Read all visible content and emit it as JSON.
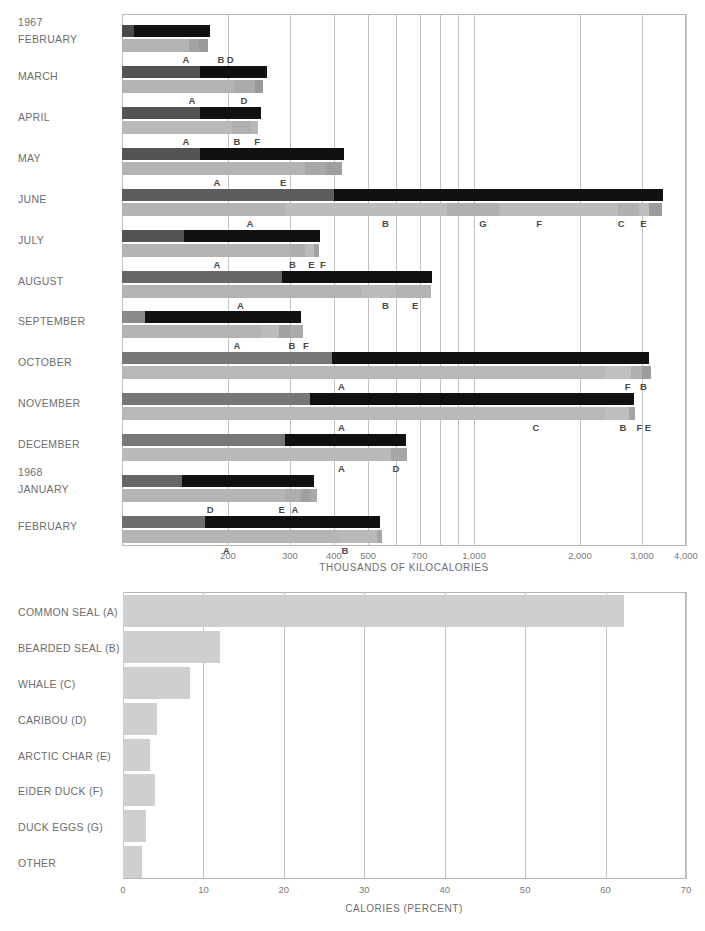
{
  "chart_data": [
    {
      "type": "bar",
      "title": "",
      "xlabel": "THOUSANDS OF KILOCALORIES",
      "ylabel": "",
      "scale": "log",
      "xlim": [
        100,
        4000
      ],
      "xticks": [
        200,
        300,
        400,
        500,
        700,
        1000,
        2000,
        3000,
        4000
      ],
      "xtick_labels": [
        "200",
        "300",
        "400",
        "500",
        "700",
        "1,000",
        "2,000",
        "3,000",
        "4,000"
      ],
      "gridlines": [
        100,
        200,
        300,
        400,
        500,
        600,
        700,
        800,
        900,
        1000,
        2000,
        3000,
        4000
      ],
      "grid": true,
      "legend": "none",
      "year_markers": [
        {
          "label": "1967",
          "row": "FEBRUARY"
        },
        {
          "label": "1968",
          "row": "JANUARY"
        }
      ],
      "categories": [
        "FEBRUARY",
        "MARCH",
        "APRIL",
        "MAY",
        "JUNE",
        "JULY",
        "AUGUST",
        "SEPTEMBER",
        "OCTOBER",
        "NOVEMBER",
        "DECEMBER",
        "JANUARY",
        "FEBRUARY"
      ],
      "rows": [
        {
          "month": "FEBRUARY",
          "year": "1967",
          "total_kcal": 178,
          "effort_segments": [
            {
              "value": 108,
              "color": "#4a4a4a"
            },
            {
              "value": 178,
              "color": "#111111"
            }
          ],
          "yield_segments": [
            {
              "value": 155,
              "color": "#b3b3b3"
            },
            {
              "value": 166,
              "color": "#a2a2a2"
            },
            {
              "value": 175,
              "color": "#9a9a9a"
            }
          ],
          "markers": [
            {
              "letter": "A",
              "value": 152
            },
            {
              "letter": "B",
              "value": 191
            },
            {
              "letter": "D",
              "value": 203
            }
          ]
        },
        {
          "month": "MARCH",
          "year": "",
          "total_kcal": 258,
          "effort_segments": [
            {
              "value": 167,
              "color": "#545454"
            },
            {
              "value": 258,
              "color": "#111111"
            }
          ],
          "yield_segments": [
            {
              "value": 208,
              "color": "#b3b3b3"
            },
            {
              "value": 238,
              "color": "#ababab"
            },
            {
              "value": 252,
              "color": "#999999"
            }
          ],
          "markers": [
            {
              "letter": "A",
              "value": 158
            },
            {
              "letter": "D",
              "value": 222
            }
          ]
        },
        {
          "month": "APRIL",
          "year": "",
          "total_kcal": 248,
          "effort_segments": [
            {
              "value": 167,
              "color": "#545454"
            },
            {
              "value": 248,
              "color": "#111111"
            }
          ],
          "yield_segments": [
            {
              "value": 205,
              "color": "#b9b9b9"
            },
            {
              "value": 232,
              "color": "#b0b0b0"
            },
            {
              "value": 243,
              "color": "#b8b8b8"
            }
          ],
          "markers": [
            {
              "letter": "A",
              "value": 152
            },
            {
              "letter": "B",
              "value": 212
            },
            {
              "letter": "F",
              "value": 242
            }
          ]
        },
        {
          "month": "MAY",
          "year": "",
          "total_kcal": 428,
          "effort_segments": [
            {
              "value": 167,
              "color": "#545454"
            },
            {
              "value": 428,
              "color": "#111111"
            }
          ],
          "yield_segments": [
            {
              "value": 330,
              "color": "#b3b3b3"
            },
            {
              "value": 380,
              "color": "#a8a8a8"
            },
            {
              "value": 422,
              "color": "#9e9e9e"
            }
          ],
          "markers": [
            {
              "letter": "A",
              "value": 186
            },
            {
              "letter": "E",
              "value": 287
            }
          ]
        },
        {
          "month": "JUNE",
          "year": "",
          "total_kcal": 3450,
          "effort_segments": [
            {
              "value": 400,
              "color": "#5c5c5c"
            },
            {
              "value": 3450,
              "color": "#111111"
            }
          ],
          "yield_segments": [
            {
              "value": 290,
              "color": "#b3b3b3"
            },
            {
              "value": 840,
              "color": "#bcbcbc"
            },
            {
              "value": 1180,
              "color": "#b0b0b0"
            },
            {
              "value": 2560,
              "color": "#bcbcbc"
            },
            {
              "value": 2950,
              "color": "#b0b0b0"
            },
            {
              "value": 3150,
              "color": "#bdbdbd"
            },
            {
              "value": 3420,
              "color": "#9c9c9c"
            }
          ],
          "markers": [
            {
              "letter": "A",
              "value": 231
            },
            {
              "letter": "B",
              "value": 560
            },
            {
              "letter": "G",
              "value": 1060
            },
            {
              "letter": "F",
              "value": 1530
            },
            {
              "letter": "C",
              "value": 2620
            },
            {
              "letter": "E",
              "value": 3030
            }
          ]
        },
        {
          "month": "JULY",
          "year": "",
          "total_kcal": 366,
          "effort_segments": [
            {
              "value": 150,
              "color": "#545454"
            },
            {
              "value": 366,
              "color": "#111111"
            }
          ],
          "yield_segments": [
            {
              "value": 300,
              "color": "#b3b3b3"
            },
            {
              "value": 330,
              "color": "#adadad"
            },
            {
              "value": 352,
              "color": "#bababa"
            },
            {
              "value": 362,
              "color": "#a3a3a3"
            }
          ],
          "markers": [
            {
              "letter": "A",
              "value": 186
            },
            {
              "letter": "B",
              "value": 305
            },
            {
              "letter": "E",
              "value": 345
            },
            {
              "letter": "F",
              "value": 372
            }
          ]
        },
        {
          "month": "AUGUST",
          "year": "",
          "total_kcal": 760,
          "effort_segments": [
            {
              "value": 284,
              "color": "#666666"
            },
            {
              "value": 760,
              "color": "#111111"
            }
          ],
          "yield_segments": [
            {
              "value": 478,
              "color": "#b3b3b3"
            },
            {
              "value": 600,
              "color": "#bbbbbb"
            },
            {
              "value": 755,
              "color": "#b3b3b3"
            }
          ],
          "markers": [
            {
              "letter": "A",
              "value": 217
            },
            {
              "letter": "B",
              "value": 560
            },
            {
              "letter": "E",
              "value": 680
            }
          ]
        },
        {
          "month": "SEPTEMBER",
          "year": "",
          "total_kcal": 322,
          "effort_segments": [
            {
              "value": 116,
              "color": "#8a8a8a"
            },
            {
              "value": 322,
              "color": "#111111"
            }
          ],
          "yield_segments": [
            {
              "value": 248,
              "color": "#b3b3b3"
            },
            {
              "value": 280,
              "color": "#bcbcbc"
            },
            {
              "value": 300,
              "color": "#a0a0a0"
            },
            {
              "value": 326,
              "color": "#aaaaaa"
            }
          ],
          "markers": [
            {
              "letter": "A",
              "value": 212
            },
            {
              "letter": "B",
              "value": 304
            },
            {
              "letter": "F",
              "value": 333
            }
          ]
        },
        {
          "month": "OCTOBER",
          "year": "",
          "total_kcal": 3150,
          "effort_segments": [
            {
              "value": 396,
              "color": "#777777"
            },
            {
              "value": 3150,
              "color": "#111111"
            }
          ],
          "yield_segments": [
            {
              "value": 2350,
              "color": "#b8b8b8"
            },
            {
              "value": 2800,
              "color": "#c0c0c0"
            },
            {
              "value": 3000,
              "color": "#b0b0b0"
            },
            {
              "value": 3180,
              "color": "#9d9d9d"
            }
          ],
          "markers": [
            {
              "letter": "A",
              "value": 420
            },
            {
              "letter": "F",
              "value": 2730
            },
            {
              "letter": "B",
              "value": 3030
            }
          ]
        },
        {
          "month": "NOVEMBER",
          "year": "",
          "total_kcal": 2850,
          "effort_segments": [
            {
              "value": 342,
              "color": "#777777"
            },
            {
              "value": 2850,
              "color": "#111111"
            }
          ],
          "yield_segments": [
            {
              "value": 2350,
              "color": "#b8b8b8"
            },
            {
              "value": 2760,
              "color": "#bebebe"
            },
            {
              "value": 2860,
              "color": "#a5a5a5"
            }
          ],
          "markers": [
            {
              "letter": "A",
              "value": 420
            },
            {
              "letter": "C",
              "value": 1500
            },
            {
              "letter": "B",
              "value": 2650
            },
            {
              "letter": "F",
              "value": 2950
            },
            {
              "letter": "E",
              "value": 3120
            }
          ]
        },
        {
          "month": "DECEMBER",
          "year": "",
          "total_kcal": 640,
          "effort_segments": [
            {
              "value": 290,
              "color": "#777777"
            },
            {
              "value": 640,
              "color": "#111111"
            }
          ],
          "yield_segments": [
            {
              "value": 580,
              "color": "#bababa"
            },
            {
              "value": 645,
              "color": "#a6a6a6"
            }
          ],
          "markers": [
            {
              "letter": "A",
              "value": 420
            },
            {
              "letter": "D",
              "value": 600
            }
          ]
        },
        {
          "month": "JANUARY",
          "year": "1968",
          "total_kcal": 352,
          "effort_segments": [
            {
              "value": 148,
              "color": "#666666"
            },
            {
              "value": 352,
              "color": "#111111"
            }
          ],
          "yield_segments": [
            {
              "value": 290,
              "color": "#b5b5b5"
            },
            {
              "value": 322,
              "color": "#adadad"
            },
            {
              "value": 342,
              "color": "#a0a0a0"
            },
            {
              "value": 358,
              "color": "#aaaaaa"
            }
          ],
          "markers": [
            {
              "letter": "D",
              "value": 178
            },
            {
              "letter": "E",
              "value": 284
            },
            {
              "letter": "A",
              "value": 310
            }
          ]
        },
        {
          "month": "FEBRUARY",
          "year": "",
          "total_kcal": 540,
          "effort_segments": [
            {
              "value": 172,
              "color": "#6e6e6e"
            },
            {
              "value": 540,
              "color": "#111111"
            }
          ],
          "yield_segments": [
            {
              "value": 420,
              "color": "#b5b5b5"
            },
            {
              "value": 530,
              "color": "#b9b9b9"
            },
            {
              "value": 548,
              "color": "#a7a7a7"
            }
          ],
          "markers": [
            {
              "letter": "A",
              "value": 198
            },
            {
              "letter": "B",
              "value": 430
            }
          ]
        }
      ]
    },
    {
      "type": "bar",
      "orientation": "horizontal",
      "title": "",
      "xlabel": "CALORIES  (PERCENT)",
      "ylabel": "",
      "xlim": [
        0,
        70
      ],
      "xticks": [
        0,
        10,
        20,
        30,
        40,
        50,
        60,
        70
      ],
      "xtick_labels": [
        "0",
        "10",
        "20",
        "30",
        "40",
        "50",
        "60",
        "70"
      ],
      "grid": true,
      "bar_color": "#cfcfcf",
      "categories": [
        "COMMON SEAL (A)",
        "BEARDED SEAL (B)",
        "WHALE (C)",
        "CARIBOU (D)",
        "ARCTIC CHAR (E)",
        "EIDER DUCK (F)",
        "DUCK EGGS (G)",
        "OTHER"
      ],
      "values": [
        62.3,
        12.1,
        8.3,
        4.2,
        3.4,
        4.0,
        2.8,
        2.4
      ]
    }
  ]
}
